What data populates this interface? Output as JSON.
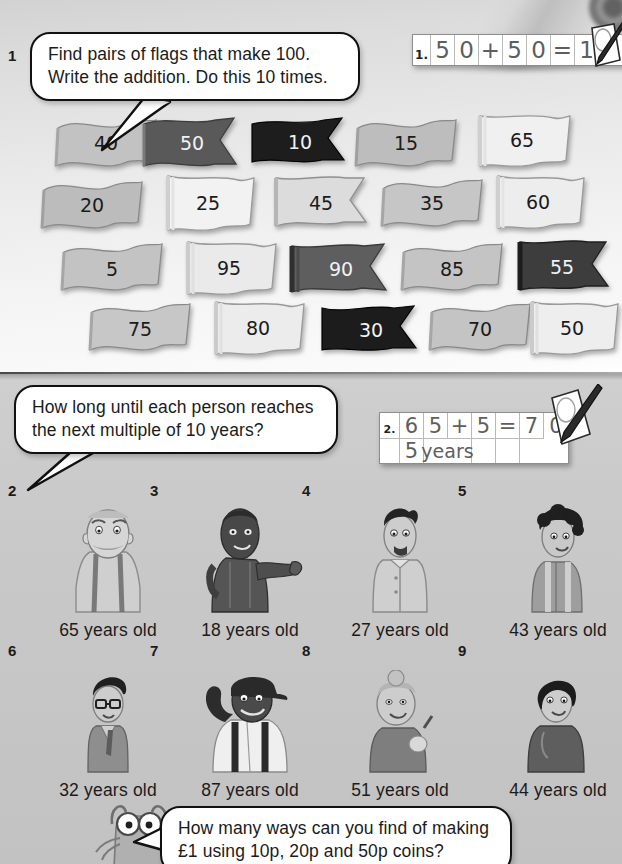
{
  "page": {
    "background_color": "#c9c9c9",
    "top_band_color": "#f2f2f2"
  },
  "task1": {
    "number": "1",
    "bubble_lines": [
      "Find pairs of flags that make 100.",
      "Write the addition. Do this 10 times."
    ],
    "answer_label": "1.",
    "answer_cells": [
      "5",
      "0",
      "+",
      "5",
      "0",
      "=",
      "1",
      "0",
      "0"
    ],
    "flags": [
      {
        "value": "40",
        "shade": "light",
        "tone": "#c2c2c2",
        "shape": "wave"
      },
      {
        "value": "50",
        "shade": "dark",
        "tone": "#595959",
        "shape": "swallow"
      },
      {
        "value": "10",
        "shade": "dark",
        "tone": "#1d1d1d",
        "shape": "swallow"
      },
      {
        "value": "15",
        "shade": "light",
        "tone": "#bdbdbd",
        "shape": "wave"
      },
      {
        "value": "65",
        "shade": "light",
        "tone": "#f0f0f0",
        "shape": "wave"
      },
      {
        "value": "20",
        "shade": "light",
        "tone": "#bcbcbc",
        "shape": "wave"
      },
      {
        "value": "25",
        "shade": "light",
        "tone": "#f2f2f2",
        "shape": "wave"
      },
      {
        "value": "45",
        "shade": "light",
        "tone": "#dcdcdc",
        "shape": "swallow"
      },
      {
        "value": "35",
        "shade": "light",
        "tone": "#c6c6c6",
        "shape": "wave"
      },
      {
        "value": "60",
        "shade": "light",
        "tone": "#ededed",
        "shape": "wave"
      },
      {
        "value": "5",
        "shade": "light",
        "tone": "#c3c3c3",
        "shape": "wave"
      },
      {
        "value": "95",
        "shade": "light",
        "tone": "#eaeaea",
        "shape": "wave"
      },
      {
        "value": "90",
        "shade": "dark",
        "tone": "#5e5e5e",
        "shape": "swallow"
      },
      {
        "value": "85",
        "shade": "light",
        "tone": "#c4c4c4",
        "shape": "wave"
      },
      {
        "value": "55",
        "shade": "dark",
        "tone": "#3d3d3d",
        "shape": "swallow"
      },
      {
        "value": "75",
        "shade": "light",
        "tone": "#c7c7c7",
        "shape": "wave"
      },
      {
        "value": "80",
        "shade": "light",
        "tone": "#ececec",
        "shape": "wave"
      },
      {
        "value": "30",
        "shade": "dark",
        "tone": "#1c1c1c",
        "shape": "swallow"
      },
      {
        "value": "70",
        "shade": "light",
        "tone": "#c4c4c4",
        "shape": "wave"
      },
      {
        "value": "50",
        "shade": "light",
        "tone": "#eeeeee",
        "shape": "wave"
      }
    ]
  },
  "task2": {
    "bubble_lines": [
      "How long until each person reaches",
      "the next multiple of 10 years?"
    ],
    "answer_label": "2.",
    "answer_cells_row1": [
      "6",
      "5",
      "+",
      "5",
      "=",
      "7",
      "0"
    ],
    "answer_cells_row2": [
      "",
      "5",
      "years",
      "",
      ""
    ],
    "people": [
      {
        "index": "2",
        "caption": "65 years old",
        "figure": "elderly-man"
      },
      {
        "index": "3",
        "caption": "18 years old",
        "figure": "young-woman"
      },
      {
        "index": "4",
        "caption": "27 years old",
        "figure": "young-man"
      },
      {
        "index": "5",
        "caption": "43 years old",
        "figure": "curly-woman"
      },
      {
        "index": "6",
        "caption": "32 years old",
        "figure": "glasses-man"
      },
      {
        "index": "7",
        "caption": "87 years old",
        "figure": "old-man-cap"
      },
      {
        "index": "8",
        "caption": "51 years old",
        "figure": "bun-woman"
      },
      {
        "index": "9",
        "caption": "44 years old",
        "figure": "bob-woman"
      }
    ]
  },
  "task3": {
    "bubble_lines": [
      "How many ways can you find of making",
      "£1 using 10p, 20p and 50p coins?"
    ],
    "character": "cat-mascot"
  }
}
